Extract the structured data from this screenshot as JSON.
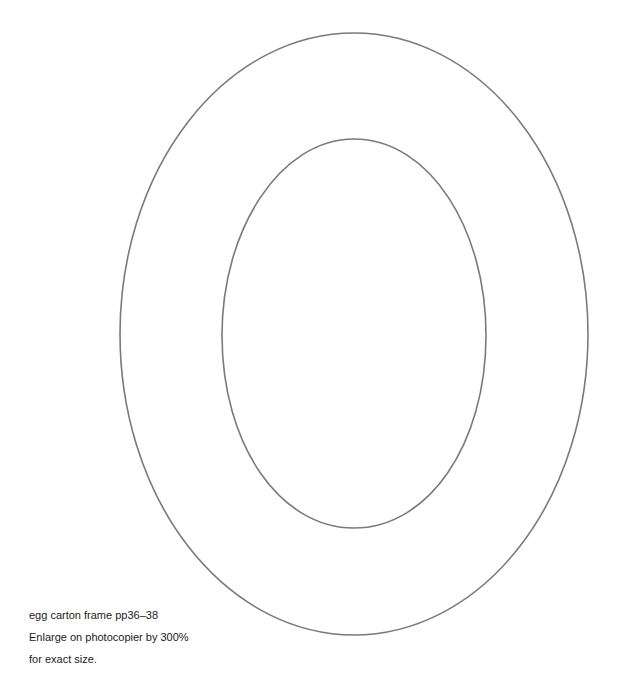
{
  "template": {
    "name": "egg carton frame",
    "outer_outline": {
      "cx": 354,
      "cy": 334,
      "rx": 234,
      "ry": 301,
      "stroke": "#7a7a7a"
    },
    "inner_outline": {
      "cx": 354,
      "cy": 333,
      "rx": 132,
      "ry": 195,
      "stroke": "#7a7a7a"
    },
    "background": "#ffffff"
  },
  "caption": {
    "line1": "egg carton frame pp36–38",
    "line2": "Enlarge on photocopier by 300%",
    "line3": "for exact size."
  }
}
